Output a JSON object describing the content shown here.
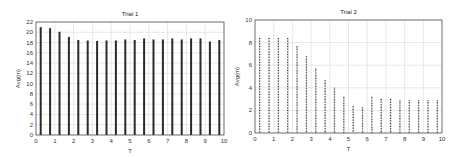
{
  "chart_data": [
    {
      "type": "bar",
      "title": "Trial 1",
      "xlabel": "T",
      "ylabel": "Avg(m)",
      "xlim": [
        0,
        10
      ],
      "ylim": [
        0,
        22
      ],
      "xticks": [
        0,
        1,
        2,
        3,
        4,
        5,
        6,
        7,
        8,
        9,
        10
      ],
      "yticks": [
        0,
        2,
        4,
        6,
        8,
        10,
        12,
        14,
        16,
        18,
        20,
        22
      ],
      "grid": true,
      "bar_style": "solid",
      "x": [
        0.25,
        0.75,
        1.25,
        1.75,
        2.25,
        2.75,
        3.25,
        3.75,
        4.25,
        4.75,
        5.25,
        5.75,
        6.25,
        6.75,
        7.25,
        7.75,
        8.25,
        8.75,
        9.25,
        9.75
      ],
      "values": [
        21.0,
        20.8,
        20.1,
        19.1,
        18.5,
        18.4,
        18.3,
        18.4,
        18.4,
        18.6,
        18.5,
        18.8,
        18.6,
        18.6,
        18.8,
        18.6,
        18.8,
        18.8,
        18.2,
        18.5
      ]
    },
    {
      "type": "bar",
      "title": "Trial 2",
      "xlabel": "T",
      "ylabel": "Avg(m)",
      "xlim": [
        0,
        10
      ],
      "ylim": [
        0,
        10
      ],
      "xticks": [
        0,
        1,
        2,
        3,
        4,
        5,
        6,
        7,
        8,
        9,
        10
      ],
      "yticks": [
        0,
        2,
        4,
        6,
        8,
        10
      ],
      "grid": true,
      "bar_style": "dotted",
      "x": [
        0.25,
        0.75,
        1.25,
        1.75,
        2.25,
        2.75,
        3.25,
        3.75,
        4.25,
        4.75,
        5.25,
        5.75,
        6.25,
        6.75,
        7.25,
        7.75,
        8.25,
        8.75,
        9.25,
        9.75
      ],
      "values": [
        8.4,
        8.4,
        8.4,
        8.4,
        7.7,
        6.8,
        5.7,
        4.7,
        4.0,
        3.2,
        2.4,
        2.3,
        3.2,
        3.0,
        3.0,
        2.9,
        2.9,
        2.9,
        2.9,
        2.9
      ]
    }
  ]
}
